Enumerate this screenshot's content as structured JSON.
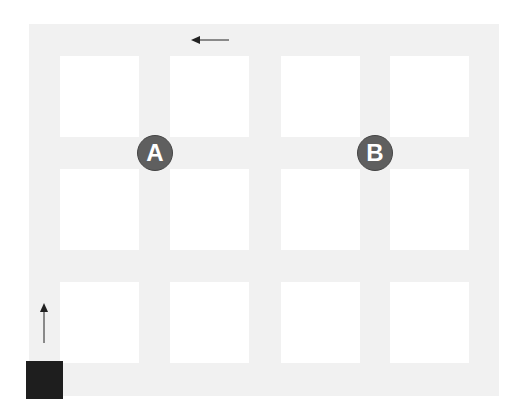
{
  "diagram": {
    "type": "street-grid-map",
    "background_color": "#f1f1f1",
    "block_color": "#ffffff",
    "grid": {
      "columns": 4,
      "rows": 3
    },
    "markers": [
      {
        "label": "A",
        "color": "#5f5f5f",
        "position": "intersection row1-row2 between col1-col2"
      },
      {
        "label": "B",
        "color": "#5f5f5f",
        "position": "intersection row1-row2 between col3-col4"
      }
    ],
    "start": {
      "shape": "square",
      "color": "#1e1e1e",
      "position": "bottom-left corner"
    },
    "arrows": [
      {
        "direction": "up",
        "position": "left street, above start"
      },
      {
        "direction": "left",
        "position": "top street"
      }
    ]
  }
}
